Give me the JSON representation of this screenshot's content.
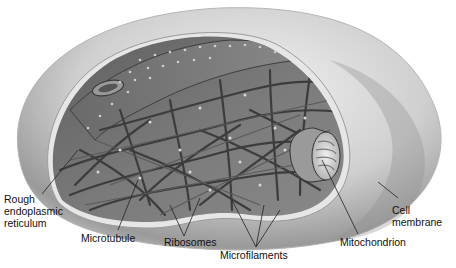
{
  "diagram": {
    "labels": [
      {
        "id": "rough-er",
        "text": "Rough\nendoplasmic\nreticulum",
        "x": 4,
        "y": 193
      },
      {
        "id": "microtubule",
        "text": "Microtubule",
        "x": 81,
        "y": 232
      },
      {
        "id": "ribosomes",
        "text": "Ribosomes",
        "x": 164,
        "y": 236
      },
      {
        "id": "microfilaments",
        "text": "Microfilaments",
        "x": 220,
        "y": 249
      },
      {
        "id": "mitochondrion",
        "text": "Mitochondrion",
        "x": 340,
        "y": 236
      },
      {
        "id": "cell-membrane",
        "text": "Cell\nmembrane",
        "x": 392,
        "y": 204
      }
    ],
    "colors": {
      "outer_shell": "#d9d9d9",
      "interior": "#6e6e6e",
      "filament": "#4a4a4a",
      "leader_line": "#222222",
      "text": "#111111"
    }
  }
}
